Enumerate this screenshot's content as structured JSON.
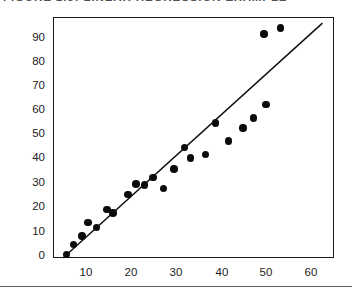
{
  "figure": {
    "title": "FIGURE 2.5: LINEAR REGRESSION EXAMPLE",
    "title_clipped": true
  },
  "axes": {
    "y_ticks": [
      "0",
      "10",
      "20",
      "30",
      "40",
      "50",
      "60",
      "70",
      "80",
      "90"
    ],
    "x_ticks": [
      "10",
      "20",
      "30",
      "40",
      "50",
      "60"
    ],
    "y_label": "",
    "x_label": ""
  },
  "colors": {
    "point": "#0b0b0b",
    "line": "#111111",
    "frame": "#1b1b1b",
    "text": "#1c1c1c",
    "background": "#ffffff",
    "footer_rule": "#5d5d5d"
  },
  "chart_data": {
    "type": "scatter",
    "title": "FIGURE 2.5: LINEAR REGRESSION EXAMPLE",
    "xlabel": "",
    "ylabel": "",
    "xlim": [
      0,
      65
    ],
    "ylim": [
      0,
      98
    ],
    "grid": false,
    "legend": null,
    "series": [
      {
        "name": "observations",
        "type": "scatter",
        "marker": "filled-circle",
        "points": [
          {
            "x": 0.8,
            "y": 1.5
          },
          {
            "x": 2.5,
            "y": 5.5
          },
          {
            "x": 4.5,
            "y": 9.0
          },
          {
            "x": 6.0,
            "y": 14.5
          },
          {
            "x": 8.0,
            "y": 12.5
          },
          {
            "x": 10.5,
            "y": 20.0
          },
          {
            "x": 12.0,
            "y": 18.5
          },
          {
            "x": 15.5,
            "y": 26.0
          },
          {
            "x": 17.5,
            "y": 30.5
          },
          {
            "x": 19.5,
            "y": 30.0
          },
          {
            "x": 21.5,
            "y": 33.0
          },
          {
            "x": 24.0,
            "y": 28.5
          },
          {
            "x": 26.5,
            "y": 36.5
          },
          {
            "x": 29.0,
            "y": 45.5
          },
          {
            "x": 30.5,
            "y": 41.0
          },
          {
            "x": 34.0,
            "y": 42.5
          },
          {
            "x": 36.5,
            "y": 55.5
          },
          {
            "x": 39.5,
            "y": 48.0
          },
          {
            "x": 43.0,
            "y": 53.5
          },
          {
            "x": 45.5,
            "y": 57.5
          },
          {
            "x": 48.5,
            "y": 63.0
          },
          {
            "x": 48.0,
            "y": 92.0
          },
          {
            "x": 52.0,
            "y": 94.5
          }
        ]
      },
      {
        "name": "fitted-regression-line",
        "type": "line",
        "endpoints": [
          {
            "x": 0.0,
            "y": 0.0
          },
          {
            "x": 62.0,
            "y": 96.5
          }
        ]
      }
    ]
  }
}
